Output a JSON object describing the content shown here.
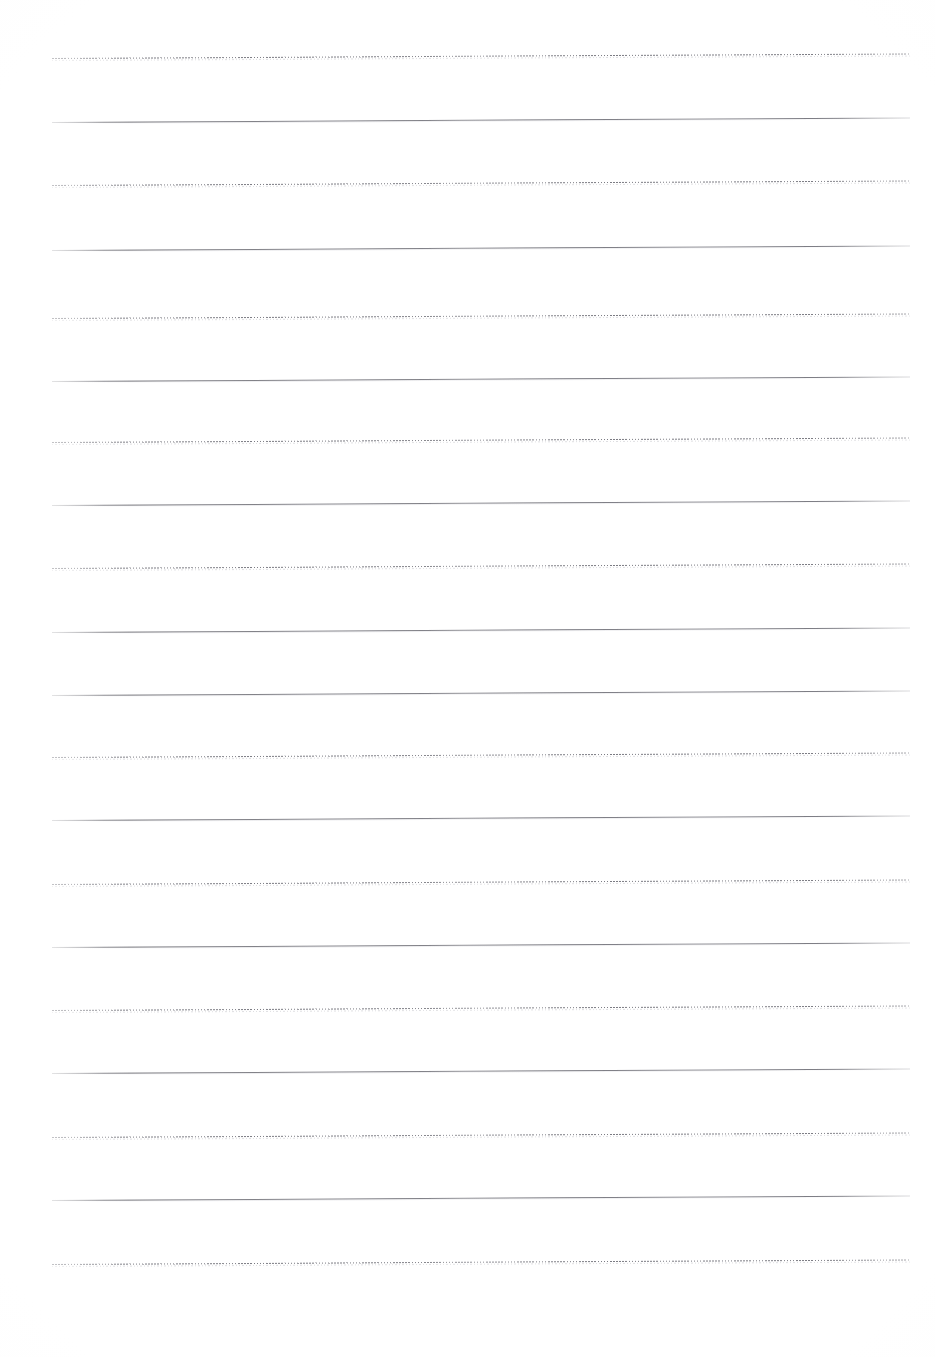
{
  "document": {
    "kind": "scanned-lined-paper",
    "title": "Blank Lined Writing Sheet",
    "page_width": 935,
    "page_height": 1357,
    "background_color": "#ffffff",
    "content_text": "",
    "has_text_content": false,
    "has_handwriting": false,
    "margins": {
      "left_px": 52,
      "right_px": 910,
      "top_px": 58,
      "bottom_px": 1264
    },
    "scan": {
      "skew_degrees": -0.3,
      "note": "Lines rise slightly from left to right due to scanner skew"
    }
  },
  "ruling": {
    "line_count": 20,
    "line_spacing_px": 63.5,
    "line_start_x": 52,
    "line_end_x": 910,
    "solid_color": "#6c6c74",
    "dotted_color": "#707078",
    "pattern_description": "Alternating dotted and solid horizontal ruling lines",
    "anomaly": "Two consecutive solid lines at y=632 and y=695; the dotted rule between them did not register in the scan",
    "lines": [
      {
        "index": 1,
        "y": 58,
        "style": "dotted"
      },
      {
        "index": 2,
        "y": 122,
        "style": "solid"
      },
      {
        "index": 3,
        "y": 185,
        "style": "dotted"
      },
      {
        "index": 4,
        "y": 250,
        "style": "solid"
      },
      {
        "index": 5,
        "y": 318,
        "style": "dotted"
      },
      {
        "index": 6,
        "y": 381,
        "style": "solid"
      },
      {
        "index": 7,
        "y": 442,
        "style": "dotted"
      },
      {
        "index": 8,
        "y": 505,
        "style": "solid"
      },
      {
        "index": 9,
        "y": 568,
        "style": "dotted"
      },
      {
        "index": 10,
        "y": 632,
        "style": "solid"
      },
      {
        "index": 11,
        "y": 695,
        "style": "solid"
      },
      {
        "index": 12,
        "y": 757,
        "style": "dotted"
      },
      {
        "index": 13,
        "y": 820,
        "style": "solid"
      },
      {
        "index": 14,
        "y": 884,
        "style": "dotted"
      },
      {
        "index": 15,
        "y": 947,
        "style": "solid"
      },
      {
        "index": 16,
        "y": 1010,
        "style": "dotted"
      },
      {
        "index": 17,
        "y": 1073,
        "style": "solid"
      },
      {
        "index": 18,
        "y": 1137,
        "style": "dotted"
      },
      {
        "index": 19,
        "y": 1200,
        "style": "solid"
      },
      {
        "index": 20,
        "y": 1264,
        "style": "dotted"
      }
    ]
  }
}
